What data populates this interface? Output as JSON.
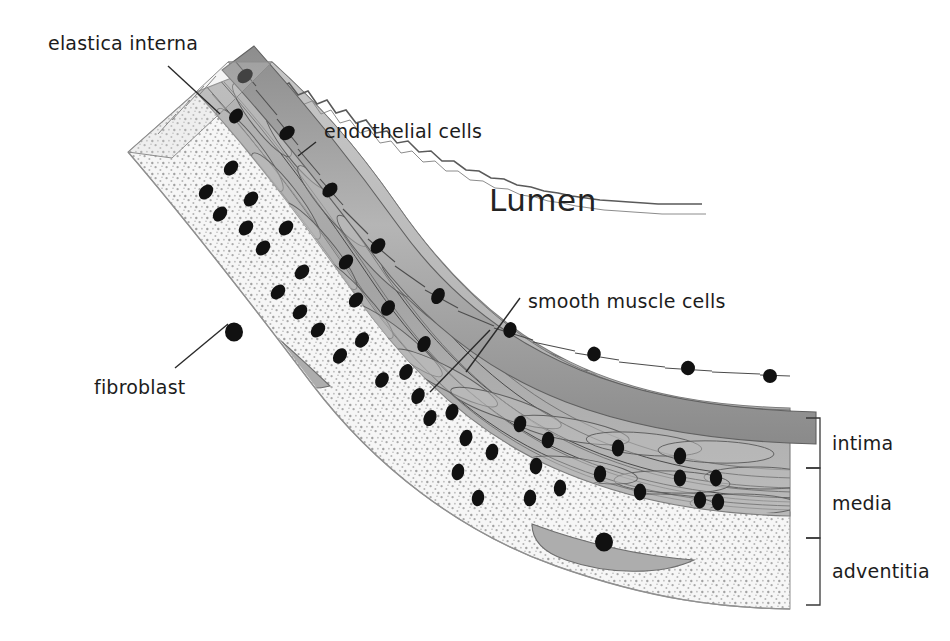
{
  "figure": {
    "title_visible": false,
    "background_color": "#ffffff",
    "ink_color": "#1c1c1c"
  },
  "labels": {
    "elastica_interna": "elastica interna",
    "endothelial_cells": "endothelial cells",
    "lumen": "Lumen",
    "smooth_muscle_cells": "smooth muscle cells",
    "fibroblast": "fibroblast",
    "intima": "intima",
    "media": "media",
    "adventitia": "adventitia"
  },
  "layers": [
    {
      "name": "intima",
      "label": "intima",
      "bracket_top_y": 418,
      "bracket_bottom_y": 468,
      "fill": "#b9b9b9"
    },
    {
      "name": "media",
      "label": "media",
      "bracket_top_y": 468,
      "bracket_bottom_y": 538,
      "fill": "#a8a8a8"
    },
    {
      "name": "adventitia",
      "label": "adventitia",
      "bracket_top_y": 538,
      "bracket_bottom_y": 605,
      "fill": "#efefef"
    }
  ],
  "structures": [
    {
      "name": "endothelium",
      "description": "single row of rectangular endothelial cells lining the lumen",
      "fill": "#9a9a9a"
    },
    {
      "name": "elastica-interna",
      "description": "crenellated wavy elastic lamina beneath endothelium",
      "stroke": "#555555"
    },
    {
      "name": "smooth-muscle",
      "description": "oblique spindle cells with dark nuclei in the media",
      "fill": "#b0b0b0"
    },
    {
      "name": "adventitia-stipple",
      "description": "stippled connective tissue with fibroblasts",
      "fill": "#f2f2f2"
    },
    {
      "name": "fibroblast",
      "description": "elongated spindle cell with round dark nucleus",
      "count": 2,
      "fill": "#adadad"
    }
  ],
  "bracket": {
    "x_spine": 820,
    "tick_length": 14,
    "label_x": 832,
    "color": "#3a3a3a"
  },
  "leaders": [
    {
      "name": "elastica-interna",
      "from": [
        168,
        66
      ],
      "to": [
        220,
        114
      ]
    },
    {
      "name": "endothelial-cells",
      "from": [
        316,
        142
      ],
      "to": [
        300,
        158
      ]
    },
    {
      "name": "smooth-muscle-cells",
      "from": [
        520,
        298
      ],
      "to": [
        455,
        388
      ]
    },
    {
      "name": "fibroblast",
      "from": [
        175,
        368
      ],
      "to": [
        225,
        322
      ]
    }
  ]
}
